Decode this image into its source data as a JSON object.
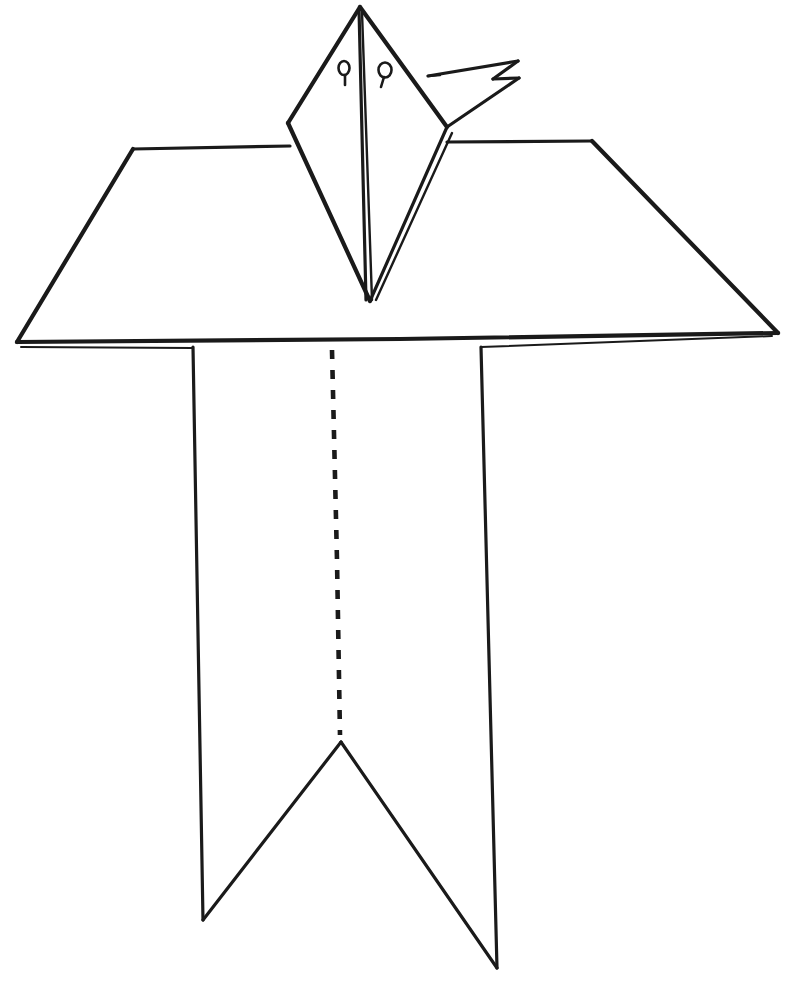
{
  "figure": {
    "background_color": "#ffffff",
    "ink_color": "#1a1a1a",
    "canvas": {
      "width": 788,
      "height": 983
    }
  },
  "parts": {
    "head": {
      "name": "bird-head",
      "apex": [
        360,
        7
      ],
      "left_corner": [
        288,
        123
      ],
      "right_corner": [
        447,
        127
      ],
      "bottom_point": [
        370,
        301
      ],
      "center_fold_label": "center vertical fold"
    },
    "beak": {
      "name": "bird-beak",
      "zigzag_points": "428,76 518,61 493,79 518,78 450,113",
      "description": "zigzag pointed beak"
    },
    "eyes": [
      {
        "name": "left-eye",
        "cx": 344,
        "cy": 68,
        "rx": 5.5,
        "ry": 7.0,
        "tail_to": [
          345,
          84
        ]
      },
      {
        "name": "right-eye",
        "cx": 385,
        "cy": 71,
        "rx": 6.5,
        "ry": 7.5,
        "tail_to": [
          382,
          86
        ]
      }
    ],
    "table": {
      "name": "folded-sheet-top",
      "top_left": [
        133,
        149
      ],
      "top_right": [
        592,
        141
      ],
      "bottom_left": [
        17,
        342
      ],
      "bottom_right": [
        778,
        333
      ],
      "description": "trapezoidal top flap of folded paper"
    },
    "body": {
      "name": "folded-sheet-skirt",
      "left_edge_x": 193,
      "right_edge_x": 481,
      "top_y": 347,
      "notch_apex": [
        341,
        742
      ],
      "left_tail_tip": [
        203,
        920
      ],
      "right_tail_tip": [
        497,
        968
      ],
      "description": "swallow-tail skirt below the sheet"
    },
    "center_fold": {
      "name": "center-fold-dashed-line",
      "style": "dashed",
      "from": [
        332,
        350
      ],
      "to": [
        340,
        735
      ],
      "description": "dashed valley fold line down the middle"
    }
  },
  "annotations": {
    "visible_text": [],
    "note": "Line drawing contains no labels or text."
  },
  "colors": {
    "ink": "#1a1a1a",
    "paper": "#ffffff"
  }
}
